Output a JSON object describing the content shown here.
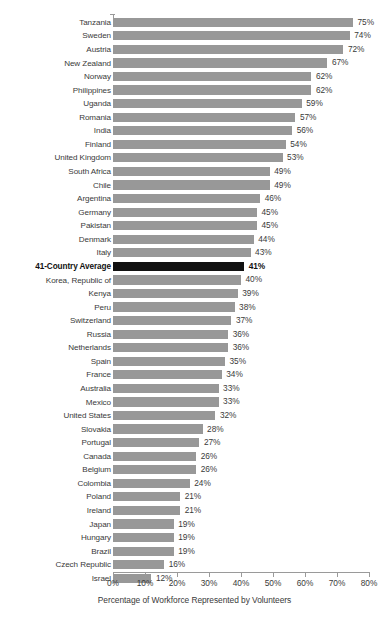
{
  "chart_data": {
    "type": "bar",
    "orientation": "horizontal",
    "title": "",
    "subtitle": "",
    "xlabel": "Percentage of Workforce Represented by Volunteers",
    "ylabel": "",
    "xlim": [
      0,
      80
    ],
    "xtick_step": 10,
    "xticks": [
      "0%",
      "10%",
      "20%",
      "30%",
      "40%",
      "50%",
      "60%",
      "70%",
      "80%"
    ],
    "xtick_values": [
      0,
      10,
      20,
      30,
      40,
      50,
      60,
      70,
      80
    ],
    "grid": false,
    "legend": null,
    "value_label_suffix": "%",
    "bar_color": "#989898",
    "highlight_color": "#111111",
    "highlight_category": "41-Country Average",
    "categories": [
      "Tanzania",
      "Sweden",
      "Austria",
      "New Zealand",
      "Norway",
      "Philippines",
      "Uganda",
      "Romania",
      "India",
      "Finland",
      "United Kingdom",
      "South Africa",
      "Chile",
      "Argentina",
      "Germany",
      "Pakistan",
      "Denmark",
      "Italy",
      "41-Country Average",
      "Korea, Republic of",
      "Kenya",
      "Peru",
      "Switzerland",
      "Russia",
      "Netherlands",
      "Spain",
      "France",
      "Australia",
      "Mexico",
      "United States",
      "Slovakia",
      "Portugal",
      "Canada",
      "Belgium",
      "Colombia",
      "Poland",
      "Ireland",
      "Japan",
      "Hungary",
      "Brazil",
      "Czech Republic",
      "Israel"
    ],
    "values": [
      75,
      74,
      72,
      67,
      62,
      62,
      59,
      57,
      56,
      54,
      53,
      49,
      49,
      46,
      45,
      45,
      44,
      43,
      41,
      40,
      39,
      38,
      37,
      36,
      36,
      35,
      34,
      33,
      33,
      32,
      28,
      27,
      26,
      26,
      24,
      21,
      21,
      19,
      19,
      19,
      16,
      12
    ],
    "value_labels": [
      "75%",
      "74%",
      "72%",
      "67%",
      "62%",
      "62%",
      "59%",
      "57%",
      "56%",
      "54%",
      "53%",
      "49%",
      "49%",
      "46%",
      "45%",
      "45%",
      "44%",
      "43%",
      "41%",
      "40%",
      "39%",
      "38%",
      "37%",
      "36%",
      "36%",
      "35%",
      "34%",
      "33%",
      "33%",
      "32%",
      "28%",
      "27%",
      "26%",
      "26%",
      "24%",
      "21%",
      "21%",
      "19%",
      "19%",
      "19%",
      "16%",
      "12%"
    ]
  }
}
